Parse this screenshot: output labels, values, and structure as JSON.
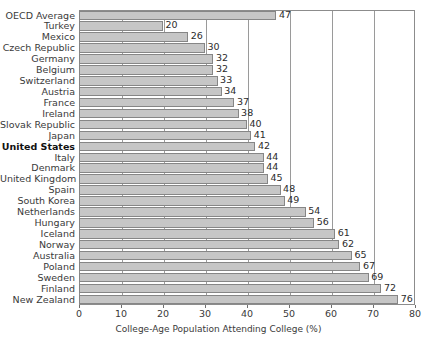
{
  "chart_data": {
    "type": "bar",
    "orientation": "horizontal",
    "title": "",
    "xlabel": "College-Age Population Attending College (%)",
    "ylabel": "",
    "xlim": [
      0,
      80
    ],
    "xticks": [
      0,
      10,
      20,
      30,
      40,
      50,
      60,
      70,
      80
    ],
    "grid": "vertical",
    "legend": "none",
    "highlight_category": "United States",
    "categories": [
      "OECD Average",
      "Turkey",
      "Mexico",
      "Czech Republic",
      "Germany",
      "Belgium",
      "Switzerland",
      "Austria",
      "France",
      "Ireland",
      "Slovak Republic",
      "Japan",
      "United States",
      "Italy",
      "Denmark",
      "United Kingdom",
      "Spain",
      "South Korea",
      "Netherlands",
      "Hungary",
      "Iceland",
      "Norway",
      "Australia",
      "Poland",
      "Sweden",
      "Finland",
      "New Zealand"
    ],
    "values": [
      47,
      20,
      26,
      30,
      32,
      32,
      33,
      34,
      37,
      38,
      40,
      41,
      42,
      44,
      44,
      45,
      48,
      49,
      54,
      56,
      61,
      62,
      65,
      67,
      69,
      72,
      76
    ],
    "colors": {
      "bar_fill": "#c6c6c6",
      "bar_border": "#868686",
      "plot_border": "#8c8c8c",
      "gridline": "#9a9a9a",
      "text": "#3a3a3a",
      "background": "#ffffff"
    }
  }
}
